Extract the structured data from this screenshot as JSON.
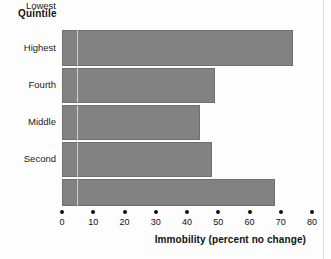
{
  "chart_data": {
    "type": "bar",
    "orientation": "horizontal",
    "title": "",
    "legend_title": "Quintile",
    "categories": [
      "Highest",
      "Fourth",
      "Middle",
      "Second",
      "Lowest"
    ],
    "values": [
      74,
      49,
      44,
      48,
      68
    ],
    "xlabel": "Immobility (percent no change)",
    "ylabel": "Quintile",
    "xlim": [
      0,
      80
    ],
    "xticks": [
      0,
      10,
      20,
      30,
      40,
      50,
      60,
      70,
      80
    ],
    "xtick_labels": [
      "0",
      "10",
      "20",
      "30",
      "40",
      "50",
      "60",
      "70",
      "80"
    ],
    "grid": false,
    "legend_position": "none",
    "bar_color": "#828282",
    "bar_edge_color": "#6f6f6f",
    "text_color": "#111111",
    "background": "#fdfdfd"
  }
}
